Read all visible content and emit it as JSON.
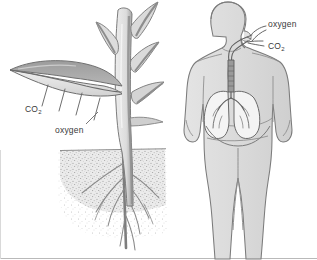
{
  "figure": {
    "width": 317,
    "height": 260,
    "background_color": "#fdfdfd",
    "border_color": "#9a9a9a",
    "style": "grayscale line drawing, textbook illustration"
  },
  "palette": {
    "outline": "#6e6e6e",
    "dark_gray": "#8c8c8c",
    "mid_gray": "#b4b4b4",
    "light_gray": "#d6d6d6",
    "very_light_gray": "#e8e8e8",
    "soil_gray": "#bdbdbd",
    "label_text": "#3a3a3a"
  },
  "plant": {
    "name": "plant",
    "parts": {
      "leaf_large": "large lance-shaped leaf angled down-left, dark gray upper surface, pale lower surface",
      "stem": "vertical pale stem with dark shaded right edge",
      "leaf_upper_left": "small upward leaf on left of stem",
      "leaf_upper_right": "small upward leaf on right of stem",
      "leaf_mid_right": "small leaf on right of stem",
      "roots": "branching tap root system below soil line",
      "soil": "stippled soil band"
    },
    "arrow_ticks": 4,
    "labels": {
      "co2": "CO",
      "co2_sub": "2",
      "oxygen": "oxygen"
    }
  },
  "human": {
    "name": "human figure",
    "parts": {
      "head": "head in profile facing right",
      "neck": "neck",
      "torso": "torso with shoulders",
      "arms": "both arms hanging at sides with hands",
      "legs": "both legs extending to bottom edge",
      "trachea": "windpipe from throat down to lungs",
      "lungs": "pair of pale lungs with bronchial branches",
      "diaphragm": "curved line below lungs",
      "nasal_passage": "nose and throat airway"
    },
    "labels": {
      "oxygen": "oxygen",
      "co2": "CO",
      "co2_sub": "2"
    }
  },
  "annotations": [
    {
      "id": "co2-plant",
      "text": "CO",
      "sub": "2",
      "target": "plant leaf",
      "direction": "outward"
    },
    {
      "id": "oxygen-plant",
      "text": "oxygen",
      "sub": "",
      "target": "plant leaf",
      "direction": "outward"
    },
    {
      "id": "oxygen-human",
      "text": "oxygen",
      "sub": "",
      "target": "human mouth",
      "direction": "inward"
    },
    {
      "id": "co2-human",
      "text": "CO",
      "sub": "2",
      "target": "human mouth",
      "direction": "outward"
    }
  ]
}
